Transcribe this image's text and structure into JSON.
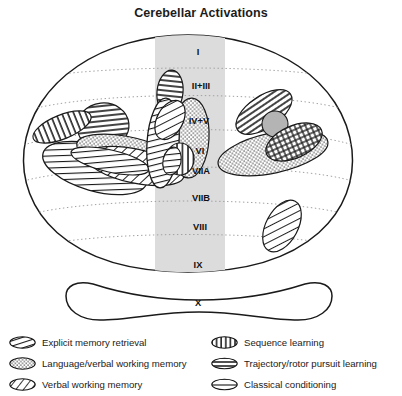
{
  "figure": {
    "title": "Cerebellar Activations",
    "type": "diagram",
    "vermis_band": {
      "fill": "#dcdcdc"
    },
    "outline_color": "#1a1a1a",
    "fissure_line_color": "#9a9a9a",
    "lobule_labels": [
      {
        "id": "lobule-i",
        "text": "I",
        "x": 198,
        "y": 32
      },
      {
        "id": "lobule-ii-iii",
        "text": "II+III",
        "x": 200,
        "y": 66
      },
      {
        "id": "lobule-iv-v",
        "text": "IV+V",
        "x": 198,
        "y": 101
      },
      {
        "id": "lobule-vi",
        "text": "VI",
        "x": 199,
        "y": 131
      },
      {
        "id": "lobule-viia",
        "text": "VIIA",
        "x": 200,
        "y": 152
      },
      {
        "id": "lobule-viib",
        "text": "VIIB",
        "x": 200,
        "y": 178
      },
      {
        "id": "lobule-viii",
        "text": "VIII",
        "x": 199,
        "y": 207
      },
      {
        "id": "lobule-ix",
        "text": "IX",
        "x": 197,
        "y": 245
      },
      {
        "id": "lobule-x",
        "text": "X",
        "x": 198,
        "y": 283
      }
    ]
  },
  "legend": {
    "left_column": [
      {
        "swatch": "steep-hatch-swatch",
        "label": "Explicit memory retrieval"
      },
      {
        "swatch": "stipple-swatch",
        "label": "Language/verbal working memory"
      },
      {
        "swatch": "diagonal-hatch-swatch",
        "label": "Verbal working memory"
      }
    ],
    "right_column": [
      {
        "swatch": "vertical-hatch-swatch",
        "label": "Sequence learning"
      },
      {
        "swatch": "dense-horizontal-swatch",
        "label": "Trajectory/rotor pursuit learning"
      },
      {
        "swatch": "sparse-horizontal-swatch",
        "label": "Classical conditioning"
      }
    ]
  }
}
